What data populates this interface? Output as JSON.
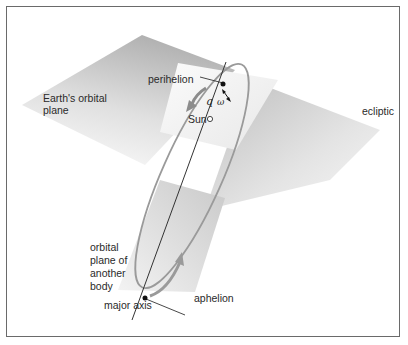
{
  "diagram": {
    "labels": {
      "earth_plane_line1": "Earth's orbital",
      "earth_plane_line2": "plane",
      "perihelion": "perihelion",
      "sun": "Sun",
      "q": "q",
      "omega": "ω",
      "ecliptic": "ecliptic",
      "orbital_plane_line1": "orbital",
      "orbital_plane_line2": "plane of",
      "orbital_plane_line3": "another",
      "orbital_plane_line4": "body",
      "major_axis": "major axis",
      "aphelion": "aphelion"
    },
    "colors": {
      "plane_dark": "#b8b8b8",
      "plane_light": "#f2f2f2",
      "orbit": "#9a9a9a",
      "line": "#333333",
      "border": "#6a6a6a"
    }
  }
}
